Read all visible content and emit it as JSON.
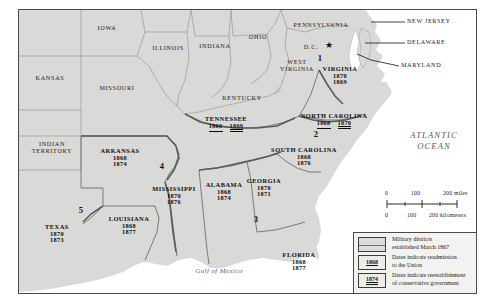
{
  "map": {
    "title": "Reconstruction Military Districts and Readmission Dates",
    "ocean_label_line1": "ATLANTIC",
    "ocean_label_line2": "OCEAN",
    "gulf_label": "Gulf of Mexico",
    "colors": {
      "land": "#d9d9d7",
      "water": "#ffffff",
      "border": "#4a4a4a",
      "district_border": "#6a6a6a",
      "legend_bg": "#f2f2f0"
    }
  },
  "non_southern_states": [
    {
      "name": "IOWA",
      "x": 88,
      "y": 18
    },
    {
      "name": "ILLINOIS",
      "x": 148,
      "y": 38
    },
    {
      "name": "INDIANA",
      "x": 195,
      "y": 36
    },
    {
      "name": "OHIO",
      "x": 243,
      "y": 27
    },
    {
      "name": "PENNSYLVANIA",
      "x": 308,
      "y": 16
    },
    {
      "name": "KANSAS",
      "x": 30,
      "y": 68
    },
    {
      "name": "MISSOURI",
      "x": 97,
      "y": 78
    },
    {
      "name": "KENTUCKY",
      "x": 223,
      "y": 88
    },
    {
      "name": "WEST VIRGINIA",
      "x": 277,
      "y": 54
    },
    {
      "name": "INDIAN TERRITORY",
      "x": 32,
      "y": 138
    }
  ],
  "pointer_states": [
    {
      "name": "NEW JERSEY",
      "x": 409,
      "y": 16
    },
    {
      "name": "DELAWARE",
      "x": 409,
      "y": 38
    },
    {
      "name": "MARYLAND",
      "x": 403,
      "y": 60
    }
  ],
  "dc": {
    "label": "D.C.",
    "x": 300,
    "y": 42,
    "star": "★"
  },
  "southern_states": [
    {
      "name": "VIRGINIA",
      "readmission": "1870",
      "conservative": "1869",
      "x": 322,
      "y": 64,
      "stacked": true
    },
    {
      "name": "NORTH CAROLINA",
      "readmission": "1868",
      "conservative": "1870",
      "x": 314,
      "y": 108,
      "stacked": false
    },
    {
      "name": "SOUTH CAROLINA",
      "readmission": "1868",
      "conservative": "1876",
      "x": 284,
      "y": 143,
      "stacked": true
    },
    {
      "name": "GEORGIA",
      "readmission": "1870",
      "conservative": "1871",
      "x": 255,
      "y": 176,
      "stacked": true
    },
    {
      "name": "FLORIDA",
      "readmission": "1868",
      "conservative": "1877",
      "x": 294,
      "y": 250,
      "stacked": true
    },
    {
      "name": "TENNESSEE",
      "readmission": "1866",
      "conservative": "1869",
      "x": 207,
      "y": 112,
      "stacked": false
    },
    {
      "name": "ALABAMA",
      "readmission": "1868",
      "conservative": "1874",
      "x": 205,
      "y": 178,
      "stacked": true
    },
    {
      "name": "MISSISSIPPI",
      "readmission": "1870",
      "conservative": "1876",
      "x": 154,
      "y": 182,
      "stacked": true
    },
    {
      "name": "ARKANSAS",
      "readmission": "1868",
      "conservative": "1874",
      "x": 101,
      "y": 144,
      "stacked": true
    },
    {
      "name": "LOUISIANA",
      "readmission": "1868",
      "conservative": "1877",
      "x": 110,
      "y": 216,
      "stacked": true
    },
    {
      "name": "TEXAS",
      "readmission": "1870",
      "conservative": "1873",
      "x": 38,
      "y": 222,
      "stacked": true
    }
  ],
  "military_districts": [
    {
      "number": "1",
      "x": 319,
      "y": 53
    },
    {
      "number": "2",
      "x": 315,
      "y": 130
    },
    {
      "number": "3",
      "x": 255,
      "y": 215
    },
    {
      "number": "4",
      "x": 160,
      "y": 163
    },
    {
      "number": "5",
      "x": 79,
      "y": 207
    }
  ],
  "scale_bar": {
    "miles_ticks": [
      "0",
      "100",
      "200 miles"
    ],
    "km_ticks": [
      "0",
      "100",
      "200 kilometers"
    ]
  },
  "legend": {
    "items": [
      {
        "kind": "swatch",
        "key": "",
        "text_line1": "Military districts",
        "text_line2": "established March 1867"
      },
      {
        "kind": "read-year",
        "key": "1868",
        "text_line1": "Dates indicate readmission",
        "text_line2": "to the Union"
      },
      {
        "kind": "cons-year",
        "key": "1874",
        "text_line1": "Dates indicate reestablishment",
        "text_line2": "of conservative government"
      }
    ]
  }
}
